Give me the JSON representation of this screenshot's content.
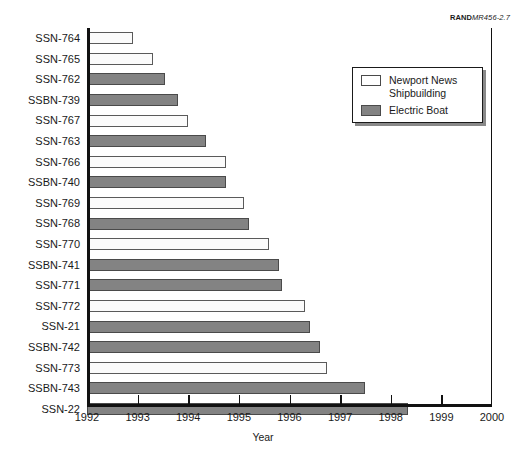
{
  "source_credit": {
    "mark": "RAND",
    "document": "MR456-2.7"
  },
  "legend": {
    "position": "top-right-inside",
    "entries": [
      {
        "label": "Newport News\nShipbuilding",
        "swatch": "nns",
        "color": "#ffffff"
      },
      {
        "label": "Electric Boat",
        "swatch": "eb",
        "color": "#838383"
      }
    ]
  },
  "chart_data": {
    "type": "bar",
    "orientation": "horizontal",
    "title": "",
    "subtitle": "",
    "xlabel": "Year",
    "ylabel": "",
    "xlim": [
      1992,
      2000
    ],
    "xticks": [
      1992,
      1993,
      1994,
      1995,
      1996,
      1997,
      1998,
      1999,
      2000
    ],
    "xtick_labels": [
      "1992",
      "1993",
      "1994",
      "1995",
      "1996",
      "1997",
      "1998",
      "1999",
      "2000"
    ],
    "grid": false,
    "legend_entries": [
      "Newport News Shipbuilding",
      "Electric Boat"
    ],
    "colors": {
      "Newport News Shipbuilding": "#ffffff",
      "Electric Boat": "#838383",
      "axis": "#111111",
      "text": "#1a1a1a"
    },
    "categories": [
      "SSN-764",
      "SSN-765",
      "SSN-762",
      "SSBN-739",
      "SSN-767",
      "SSN-763",
      "SSN-766",
      "SSBN-740",
      "SSN-769",
      "SSN-768",
      "SSN-770",
      "SSBN-741",
      "SSN-771",
      "SSN-772",
      "SSN-21",
      "SSBN-742",
      "SSN-773",
      "SSBN-743",
      "SSN-22"
    ],
    "bars": [
      {
        "category": "SSN-764",
        "builder": "Newport News Shipbuilding",
        "swatch": "nns",
        "start": 1992,
        "end": 1992.9,
        "value": 0.9
      },
      {
        "category": "SSN-765",
        "builder": "Newport News Shipbuilding",
        "swatch": "nns",
        "start": 1992,
        "end": 1993.3,
        "value": 1.3
      },
      {
        "category": "SSN-762",
        "builder": "Electric Boat",
        "swatch": "eb",
        "start": 1992,
        "end": 1993.55,
        "value": 1.55
      },
      {
        "category": "SSBN-739",
        "builder": "Electric Boat",
        "swatch": "eb",
        "start": 1992,
        "end": 1993.8,
        "value": 1.8
      },
      {
        "category": "SSN-767",
        "builder": "Newport News Shipbuilding",
        "swatch": "nns",
        "start": 1992,
        "end": 1994.0,
        "value": 2.0
      },
      {
        "category": "SSN-763",
        "builder": "Electric Boat",
        "swatch": "eb",
        "start": 1992,
        "end": 1994.35,
        "value": 2.35
      },
      {
        "category": "SSN-766",
        "builder": "Newport News Shipbuilding",
        "swatch": "nns",
        "start": 1992,
        "end": 1994.75,
        "value": 2.75
      },
      {
        "category": "SSBN-740",
        "builder": "Electric Boat",
        "swatch": "eb",
        "start": 1992,
        "end": 1994.75,
        "value": 2.75
      },
      {
        "category": "SSN-769",
        "builder": "Newport News Shipbuilding",
        "swatch": "nns",
        "start": 1992,
        "end": 1995.1,
        "value": 3.1
      },
      {
        "category": "SSN-768",
        "builder": "Electric Boat",
        "swatch": "eb",
        "start": 1992,
        "end": 1995.2,
        "value": 3.2
      },
      {
        "category": "SSN-770",
        "builder": "Newport News Shipbuilding",
        "swatch": "nns",
        "start": 1992,
        "end": 1995.6,
        "value": 3.6
      },
      {
        "category": "SSBN-741",
        "builder": "Electric Boat",
        "swatch": "eb",
        "start": 1992,
        "end": 1995.8,
        "value": 3.8
      },
      {
        "category": "SSN-771",
        "builder": "Electric Boat",
        "swatch": "eb",
        "start": 1992,
        "end": 1995.85,
        "value": 3.85
      },
      {
        "category": "SSN-772",
        "builder": "Newport News Shipbuilding",
        "swatch": "nns",
        "start": 1992,
        "end": 1996.3,
        "value": 4.3
      },
      {
        "category": "SSN-21",
        "builder": "Electric Boat",
        "swatch": "eb",
        "start": 1992,
        "end": 1996.4,
        "value": 4.4
      },
      {
        "category": "SSBN-742",
        "builder": "Electric Boat",
        "swatch": "eb",
        "start": 1992,
        "end": 1996.6,
        "value": 4.6
      },
      {
        "category": "SSN-773",
        "builder": "Newport News Shipbuilding",
        "swatch": "nns",
        "start": 1992,
        "end": 1996.75,
        "value": 4.75
      },
      {
        "category": "SSBN-743",
        "builder": "Electric Boat",
        "swatch": "eb",
        "start": 1992,
        "end": 1997.5,
        "value": 5.5
      },
      {
        "category": "SSN-22",
        "builder": "Electric Boat",
        "swatch": "eb",
        "start": 1992,
        "end": 1998.35,
        "value": 6.35
      }
    ]
  }
}
